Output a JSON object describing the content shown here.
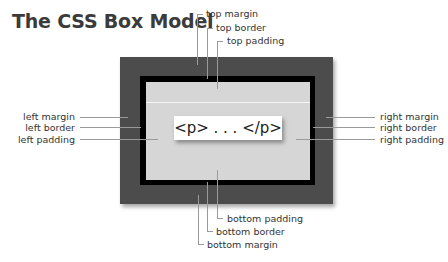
{
  "title": "The CSS Box Model",
  "content": "<p> . . . </p>",
  "labels": {
    "top_margin": "top margin",
    "top_border": "top border",
    "top_padding": "top padding",
    "left_margin": "left margin",
    "left_border": "left border",
    "left_padding": "left padding",
    "right_margin": "right margin",
    "right_border": "right border",
    "right_padding": "right padding",
    "bottom_padding": "bottom padding",
    "bottom_border": "bottom border",
    "bottom_margin": "bottom margin"
  },
  "colors": {
    "margin": "#4c4c4c",
    "border": "#000000",
    "padding": "#d6d6d6",
    "content": "#ffffff"
  }
}
